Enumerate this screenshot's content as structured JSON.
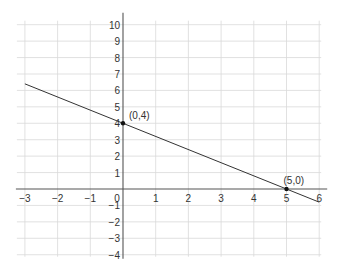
{
  "chart_data": {
    "type": "line",
    "title": "",
    "xlabel": "",
    "ylabel": "",
    "xlim": [
      -3,
      6
    ],
    "ylim": [
      -4,
      10
    ],
    "grid": true,
    "x_ticks": [
      -3,
      -2,
      -1,
      0,
      1,
      2,
      3,
      4,
      5,
      6
    ],
    "y_ticks": [
      -4,
      -3,
      -2,
      -1,
      1,
      2,
      3,
      4,
      5,
      6,
      7,
      8,
      9,
      10
    ],
    "x_tick_labels": [
      "−3",
      "−2",
      "−1",
      "0",
      "1",
      "2",
      "3",
      "4",
      "5",
      "6"
    ],
    "y_tick_labels": [
      "−4",
      "−3",
      "−2",
      "−1",
      "1",
      "2",
      "3",
      "4",
      "5",
      "6",
      "7",
      "8",
      "9",
      "10"
    ],
    "series": [
      {
        "name": "y = -4/5 x + 4",
        "x": [
          -3,
          6
        ],
        "y": [
          6.4,
          -0.8
        ]
      }
    ],
    "points": [
      {
        "x": 0,
        "y": 4,
        "label": "(0,4)"
      },
      {
        "x": 5,
        "y": 0,
        "label": "(5,0)"
      }
    ]
  },
  "colors": {
    "grid": "#d9d9d9",
    "axis": "#555555",
    "line": "#333333",
    "point": "#111111"
  }
}
